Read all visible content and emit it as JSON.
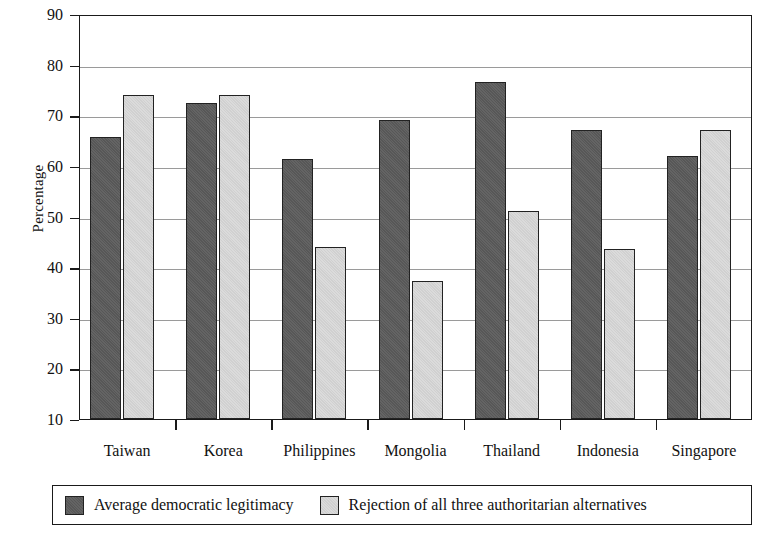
{
  "chart_data": {
    "type": "bar",
    "title": "",
    "xlabel": "",
    "ylabel": "Percentage",
    "ylim": [
      10,
      90
    ],
    "ytick_step": 10,
    "yticks": [
      90,
      80,
      70,
      60,
      50,
      40,
      30,
      20,
      10
    ],
    "grid": true,
    "legend_position": "bottom",
    "categories": [
      "Taiwan",
      "Korea",
      "Philippines",
      "Mongolia",
      "Thailand",
      "Indonesia",
      "Singapore"
    ],
    "series": [
      {
        "name": "Average democratic legitimacy",
        "color": "#5c5c5c",
        "values": [
          65.8,
          72.5,
          61.3,
          69.0,
          76.5,
          67.0,
          62.0
        ]
      },
      {
        "name": "Rejection of all three authoritarian alternatives",
        "color": "#d9d9d9",
        "values": [
          74.0,
          74.0,
          44.0,
          37.3,
          51.0,
          43.5,
          67.0
        ]
      }
    ]
  },
  "axis": {
    "y_label": "Percentage"
  },
  "legend": {
    "items": [
      {
        "label": "Average democratic legitimacy",
        "swatch": "dark"
      },
      {
        "label": "Rejection of all three authoritarian alternatives",
        "swatch": "light"
      }
    ]
  }
}
